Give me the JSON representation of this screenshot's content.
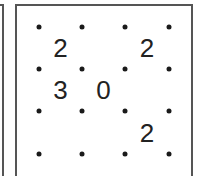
{
  "puzzle": {
    "type": "slitherlink",
    "rows": 3,
    "cols": 3,
    "dot_x": [
      39,
      82,
      125,
      169
    ],
    "dot_y": [
      27,
      69,
      111,
      154
    ],
    "clues": [
      [
        "2",
        "",
        "2"
      ],
      [
        "3",
        "0",
        ""
      ],
      [
        "",
        "",
        "2"
      ]
    ]
  },
  "colors": {
    "border": "#555555",
    "dot": "#1a1a1a",
    "clue_text": "#222222",
    "background": "#ffffff"
  }
}
